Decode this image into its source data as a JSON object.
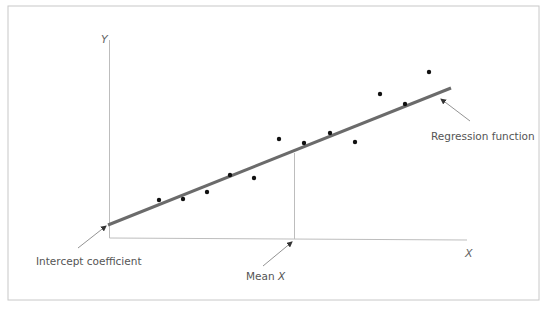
{
  "chart_data": {
    "type": "scatter",
    "title": "",
    "xlabel": "X",
    "ylabel": "Y",
    "grid": false,
    "points": [
      {
        "x": 159,
        "y": 200
      },
      {
        "x": 183,
        "y": 199
      },
      {
        "x": 207,
        "y": 192
      },
      {
        "x": 230,
        "y": 175
      },
      {
        "x": 254,
        "y": 178
      },
      {
        "x": 279,
        "y": 139
      },
      {
        "x": 304,
        "y": 143
      },
      {
        "x": 330,
        "y": 133
      },
      {
        "x": 355,
        "y": 142
      },
      {
        "x": 380,
        "y": 94
      },
      {
        "x": 405,
        "y": 104
      },
      {
        "x": 429,
        "y": 72
      }
    ],
    "regression_line": {
      "x1": 108,
      "y1": 225,
      "x2": 451,
      "y2": 88
    },
    "mean_x": 294,
    "annotations": [
      "Regression function",
      "Intercept coefficient",
      "Mean X"
    ]
  },
  "labels": {
    "y_axis": "Y",
    "x_axis": "X",
    "regression": "Regression function",
    "intercept": "Intercept coefficient",
    "mean_prefix": "Mean ",
    "mean_var": "X"
  },
  "colors": {
    "frame": "#c8c8c8",
    "axis": "#bdbdbd",
    "regression_line": "#6b6b6b",
    "dot": "#111111",
    "text": "#555555"
  }
}
